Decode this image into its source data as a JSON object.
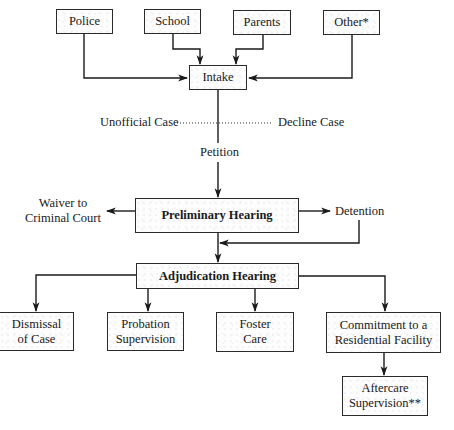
{
  "diagram": {
    "sources": [
      {
        "id": "police",
        "label": "Police"
      },
      {
        "id": "school",
        "label": "School"
      },
      {
        "id": "parents",
        "label": "Parents"
      },
      {
        "id": "other",
        "label": "Other*"
      }
    ],
    "intake": {
      "label": "Intake"
    },
    "intake_outcomes": {
      "left": "Unofficial Case",
      "right": "Decline Case",
      "down": "Petition"
    },
    "preliminary_hearing": {
      "label": "Preliminary Hearing"
    },
    "preliminary_outcomes": {
      "left_line1": "Waiver to",
      "left_line2": "Criminal Court",
      "right": "Detention"
    },
    "adjudication_hearing": {
      "label": "Adjudication Hearing"
    },
    "dispositions": [
      {
        "id": "dismissal",
        "line1": "Dismissal",
        "line2": "of Case"
      },
      {
        "id": "probation",
        "line1": "Probation",
        "line2": "Supervision"
      },
      {
        "id": "foster",
        "line1": "Foster",
        "line2": "Care"
      },
      {
        "id": "commitment",
        "line1": "Commitment to a",
        "line2": "Residential Facility"
      }
    ],
    "aftercare": {
      "line1": "Aftercare",
      "line2": "Supervision**"
    },
    "edges": [
      {
        "from": "Police",
        "to": "Intake"
      },
      {
        "from": "School",
        "to": "Intake"
      },
      {
        "from": "Parents",
        "to": "Intake"
      },
      {
        "from": "Other*",
        "to": "Intake"
      },
      {
        "from": "Intake",
        "to": "Unofficial Case",
        "style": "dotted"
      },
      {
        "from": "Intake",
        "to": "Decline Case",
        "style": "dotted"
      },
      {
        "from": "Intake",
        "to": "Petition"
      },
      {
        "from": "Petition",
        "to": "Preliminary Hearing"
      },
      {
        "from": "Preliminary Hearing",
        "to": "Waiver to Criminal Court"
      },
      {
        "from": "Preliminary Hearing",
        "to": "Detention"
      },
      {
        "from": "Preliminary Hearing",
        "to": "Adjudication Hearing"
      },
      {
        "from": "Detention",
        "to": "Adjudication Hearing"
      },
      {
        "from": "Adjudication Hearing",
        "to": "Dismissal of Case"
      },
      {
        "from": "Adjudication Hearing",
        "to": "Probation Supervision"
      },
      {
        "from": "Adjudication Hearing",
        "to": "Foster Care"
      },
      {
        "from": "Adjudication Hearing",
        "to": "Commitment to a Residential Facility"
      },
      {
        "from": "Commitment to a Residential Facility",
        "to": "Aftercare Supervision**"
      }
    ]
  }
}
